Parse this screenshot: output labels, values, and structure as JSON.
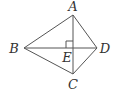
{
  "diagram": {
    "type": "geometry",
    "points": [
      {
        "id": "A",
        "label": "A",
        "x": 73,
        "y": 15,
        "lx": 73,
        "ly": 11
      },
      {
        "id": "B",
        "label": "B",
        "x": 24,
        "y": 48,
        "lx": 14,
        "ly": 53
      },
      {
        "id": "C",
        "label": "C",
        "x": 73,
        "y": 74,
        "lx": 73,
        "ly": 89
      },
      {
        "id": "D",
        "label": "D",
        "x": 97,
        "y": 48,
        "lx": 105,
        "ly": 53
      },
      {
        "id": "E",
        "label": "E",
        "x": 73,
        "y": 48,
        "lx": 67,
        "ly": 62
      }
    ],
    "segments": [
      {
        "from": "A",
        "to": "B"
      },
      {
        "from": "B",
        "to": "C"
      },
      {
        "from": "C",
        "to": "D"
      },
      {
        "from": "D",
        "to": "A"
      },
      {
        "from": "A",
        "to": "C"
      },
      {
        "from": "B",
        "to": "D"
      }
    ],
    "right_angle": {
      "at": "E",
      "size": 7
    },
    "colors": {
      "line": "#555555",
      "label": "#333333"
    }
  }
}
